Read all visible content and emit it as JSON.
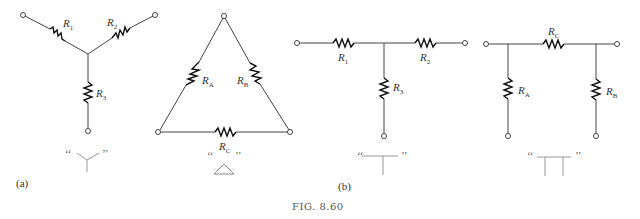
{
  "figure": {
    "caption": "FIG. 8.60",
    "panels": [
      {
        "label": "(a)",
        "networks": [
          {
            "name": "wye",
            "symbol_label": "Y",
            "resistors": [
              "R1",
              "R2",
              "R3"
            ]
          },
          {
            "name": "delta",
            "symbol_label": "Δ",
            "resistors": [
              "RA",
              "RB",
              "RC"
            ]
          }
        ]
      },
      {
        "label": "(b)",
        "networks": [
          {
            "name": "tee",
            "symbol_label": "T",
            "resistors": [
              "R1",
              "R2",
              "R3"
            ]
          },
          {
            "name": "pi",
            "symbol_label": "Π",
            "resistors": [
              "RA",
              "RB",
              "RC"
            ]
          }
        ]
      }
    ],
    "labels": {
      "R": "R",
      "sub1": "1",
      "sub2": "2",
      "sub3": "3",
      "subA": "A",
      "subB": "B",
      "subC": "C",
      "open_quote": "‘‘",
      "close_quote": "’’",
      "panel_a": "(a)",
      "panel_b": "(b)"
    },
    "colors": {
      "line": "#444444",
      "resistor": "#111111",
      "text": "#333333"
    }
  }
}
